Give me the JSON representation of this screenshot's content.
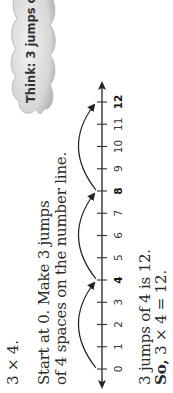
{
  "problem": {
    "expression": "3 × 4.",
    "instructions_line1": "Start at 0. Make 3 jumps",
    "instructions_line2": "of 4 spaces on the number line."
  },
  "thought_bubble": {
    "text": "Think: 3 jumps of 4"
  },
  "number_line": {
    "start": 0,
    "end": 12,
    "labels": [
      "0",
      "1",
      "2",
      "3",
      "4",
      "5",
      "6",
      "7",
      "8",
      "9",
      "10",
      "11",
      "12"
    ],
    "highlighted": [
      "4",
      "8",
      "12"
    ],
    "jump_size": 4,
    "jumps": [
      {
        "from": 0,
        "to": 4
      },
      {
        "from": 4,
        "to": 8
      },
      {
        "from": 8,
        "to": 12
      }
    ]
  },
  "result": {
    "line1": "3 jumps of 4 is 12.",
    "line2_prefix": "So,",
    "line2_rest": " 3 × 4 = 12."
  },
  "colors": {
    "text": "#2a2a2a",
    "cloud_fill": "#d8d8d8",
    "line": "#222222"
  }
}
